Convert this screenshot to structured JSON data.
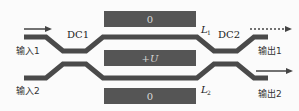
{
  "diagram": {
    "type": "mach-zehnder-interferometer",
    "colors": {
      "waveguide": "#4a4a4a",
      "electrode": "#555555",
      "electrode_text": "#dddddd",
      "arrow": "#444444",
      "background": "#fbfbfb"
    },
    "couplers": {
      "dc1": "DC1",
      "dc2": "DC2"
    },
    "arms": {
      "l1": "L",
      "l1_sub": "1",
      "l2": "L",
      "l2_sub": "2"
    },
    "electrodes": {
      "top": "0",
      "middle": "+U",
      "bottom": "0"
    },
    "ports": {
      "input1": "输入1",
      "input2": "输入2",
      "output1": "输出1",
      "output2": "输出2"
    }
  }
}
